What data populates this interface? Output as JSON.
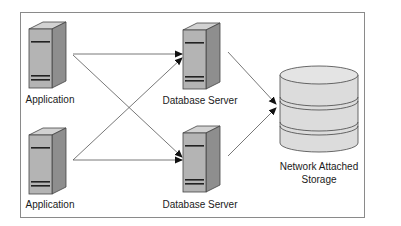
{
  "diagram": {
    "nodes": {
      "app1": {
        "label": "Application",
        "type": "server"
      },
      "app2": {
        "label": "Application",
        "type": "server"
      },
      "db1": {
        "label": "Database Server",
        "type": "server"
      },
      "db2": {
        "label": "Database Server",
        "type": "server"
      },
      "nas": {
        "label_line1": "Network Attached",
        "label_line2": "Storage",
        "type": "storage"
      }
    },
    "edges": [
      {
        "from": "app1",
        "to": "db1"
      },
      {
        "from": "app1",
        "to": "db2"
      },
      {
        "from": "app2",
        "to": "db1"
      },
      {
        "from": "app2",
        "to": "db2"
      },
      {
        "from": "db1",
        "to": "nas"
      },
      {
        "from": "db2",
        "to": "nas"
      }
    ],
    "colors": {
      "server_front": "#b4b4b4",
      "server_side": "#8e8e8e",
      "server_top": "#d2d2d2",
      "storage_fill": "#dcdcdc",
      "line": "#555555",
      "border": "#8a8a8a"
    }
  }
}
